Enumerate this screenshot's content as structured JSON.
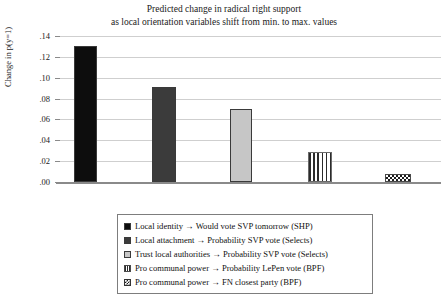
{
  "chart_data": {
    "type": "bar",
    "title": "Predicted change in radical right support\nas local orientation variables shift from min. to max. values",
    "title_line1": "Predicted change in radical right support",
    "title_line2": "as local orientation variables shift from min. to max. values",
    "xlabel": "",
    "ylabel": "Change in p(y=1)",
    "ylim": [
      0,
      0.14
    ],
    "yticks": [
      0.0,
      0.02,
      0.04,
      0.06,
      0.08,
      0.1,
      0.12,
      0.14
    ],
    "ytick_labels": [
      ".00",
      ".02",
      ".04",
      ".06",
      ".08",
      ".10",
      ".12",
      ".14"
    ],
    "grid": true,
    "legend_position": "bottom",
    "categories": [
      "Local identity → Would vote SVP tomorrow (SHP)",
      "Local attachment → Probability SVP vote (Selects)",
      "Trust local authorities → Probability SVP vote (Selects)",
      "Pro communal power → Probability LePen vote (BPF)",
      "Pro communal power → FN closest party (BPF)"
    ],
    "values": [
      0.13,
      0.091,
      0.07,
      0.029,
      0.008
    ],
    "bars": [
      {
        "label": "Local identity → Would vote SVP tomorrow (SHP)",
        "value": 0.13,
        "fill": "#0d0d0d",
        "pattern": "solid"
      },
      {
        "label": "Local attachment → Probability SVP vote (Selects)",
        "value": 0.091,
        "fill": "#3b3b3b",
        "pattern": "solid"
      },
      {
        "label": "Trust local authorities → Probability SVP vote (Selects)",
        "value": 0.07,
        "fill": "#c6c6c6",
        "pattern": "solid"
      },
      {
        "label": "Pro communal power → Probability LePen vote (BPF)",
        "value": 0.029,
        "fill": "#ffffff",
        "pattern": "vertical-stripes"
      },
      {
        "label": "Pro communal power → FN closest party (BPF)",
        "value": 0.008,
        "fill": "#ffffff",
        "pattern": "checkerboard"
      }
    ],
    "colors": {
      "gridline": "#cfcfcf",
      "axis": "#8a8a8a",
      "text": "#1a1a1a",
      "legend_border": "#7d7d7d"
    }
  },
  "legend": {
    "items": [
      {
        "label": "Local identity → Would vote SVP tomorrow (SHP)",
        "swatch": "solid-black-swatch"
      },
      {
        "label": "Local attachment → Probability SVP vote (Selects)",
        "swatch": "solid-darkgray-swatch"
      },
      {
        "label": "Trust local authorities → Probability SVP vote (Selects)",
        "swatch": "solid-lightgray-swatch"
      },
      {
        "label": "Pro communal power → Probability LePen vote (BPF)",
        "swatch": "vertical-stripe-swatch"
      },
      {
        "label": "Pro communal power → FN closest party (BPF)",
        "swatch": "checkerboard-swatch"
      }
    ]
  }
}
